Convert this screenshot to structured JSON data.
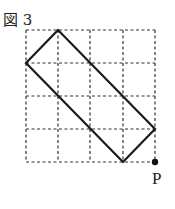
{
  "figure": {
    "title": "図 3",
    "point_label": "P",
    "grid": {
      "cols": 4,
      "rows": 4
    },
    "rectangle_vertices_grid": [
      [
        1,
        0
      ],
      [
        0,
        1
      ],
      [
        3,
        4
      ],
      [
        4,
        3
      ]
    ],
    "point_grid": [
      4,
      4
    ],
    "colors": {
      "grid": "#333333",
      "shape": "#1a1a1a"
    }
  }
}
